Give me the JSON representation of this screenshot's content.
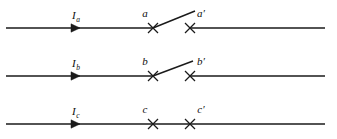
{
  "figure": {
    "type": "ray-diagram",
    "background_color": "#ffffff",
    "stroke_color": "#1a1a1a",
    "width": 337,
    "height": 139
  },
  "rows": [
    {
      "id": "row-a",
      "axis_y": 28,
      "axis_x_start": 6,
      "axis_x_end": 325,
      "arrow_x": 80,
      "ray_label": "I",
      "ray_subscript": "a",
      "ray_label_x": 72,
      "ray_label_y": 19,
      "point_label": "a",
      "point_label_x": 145,
      "point_label_y": 17,
      "point_x": 153,
      "prime_label": "a",
      "prime_mark": "′",
      "prime_label_x": 201,
      "prime_label_y": 17,
      "prime_x": 190,
      "has_diagonal": true,
      "diagonal_x1": 153,
      "diagonal_y1": 28,
      "diagonal_x2": 195,
      "diagonal_y2": 11,
      "gap_start": 153,
      "gap_end": 190
    },
    {
      "id": "row-b",
      "axis_y": 76,
      "axis_x_start": 6,
      "axis_x_end": 325,
      "arrow_x": 80,
      "ray_label": "I",
      "ray_subscript": "b",
      "ray_label_x": 72,
      "ray_label_y": 67,
      "point_label": "b",
      "point_label_x": 145,
      "point_label_y": 65,
      "point_x": 153,
      "prime_label": "b",
      "prime_mark": "′",
      "prime_label_x": 201,
      "prime_label_y": 65,
      "prime_x": 190,
      "has_diagonal": true,
      "diagonal_x1": 153,
      "diagonal_y1": 76,
      "diagonal_x2": 193,
      "diagonal_y2": 61,
      "gap_start": 153,
      "gap_end": 190
    },
    {
      "id": "row-c",
      "axis_y": 124,
      "axis_x_start": 6,
      "axis_x_end": 325,
      "arrow_x": 80,
      "ray_label": "I",
      "ray_subscript": "c",
      "ray_label_x": 72,
      "ray_label_y": 115,
      "point_label": "c",
      "point_label_x": 145,
      "point_label_y": 113,
      "point_x": 153,
      "prime_label": "c",
      "prime_mark": "′",
      "prime_label_x": 201,
      "prime_label_y": 113,
      "prime_x": 190,
      "has_diagonal": false,
      "gap_start": null,
      "gap_end": null
    }
  ],
  "marker": {
    "kind": "x-cross",
    "half_size": 5
  }
}
